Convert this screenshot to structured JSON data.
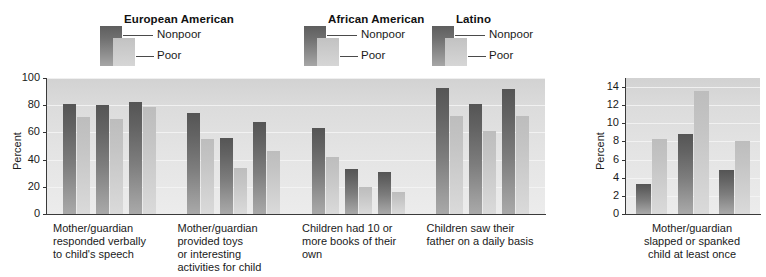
{
  "legend": {
    "groups": [
      {
        "title": "European American",
        "left": 78
      },
      {
        "title": "African American",
        "left": 282
      },
      {
        "title": "Latino",
        "left": 410
      }
    ],
    "series": [
      {
        "label": "Nonpoor",
        "swatch": "dark",
        "color": "#6f6f6f"
      },
      {
        "label": "Poor",
        "swatch": "light",
        "color": "#cacaca"
      }
    ]
  },
  "chart_data": [
    {
      "id": "main",
      "type": "bar",
      "title": "",
      "xlabel": "",
      "ylabel": "Percent",
      "ylim": [
        0,
        100
      ],
      "yticks": [
        0,
        20,
        40,
        60,
        80,
        100
      ],
      "grid": true,
      "legend_position": "above",
      "categories": [
        "Mother/guardian\nresponded verbally\nto child's speech",
        "Mother/guardian\nprovided toys\nor interesting\nactivities for child",
        "Children had 10 or\nmore books of their\nown",
        "Children saw their\nfather on a daily basis"
      ],
      "group_names": [
        "European American",
        "African American",
        "Latino"
      ],
      "series": [
        {
          "name": "Nonpoor",
          "values": [
            81,
            80,
            82,
            74,
            56,
            68,
            63,
            33,
            31,
            93,
            81,
            92
          ]
        },
        {
          "name": "Poor",
          "values": [
            71,
            70,
            79,
            55,
            34,
            46,
            42,
            20,
            16,
            72,
            61,
            72
          ]
        }
      ],
      "bars": [
        {
          "category": "Mother/guardian responded verbally to child's speech",
          "group": "European American",
          "nonpoor": 81,
          "poor": 71
        },
        {
          "category": "Mother/guardian responded verbally to child's speech",
          "group": "African American",
          "nonpoor": 80,
          "poor": 70
        },
        {
          "category": "Mother/guardian responded verbally to child's speech",
          "group": "Latino",
          "nonpoor": 82,
          "poor": 79
        },
        {
          "category": "Mother/guardian provided toys or interesting activities for child",
          "group": "European American",
          "nonpoor": 74,
          "poor": 55
        },
        {
          "category": "Mother/guardian provided toys or interesting activities for child",
          "group": "African American",
          "nonpoor": 56,
          "poor": 34
        },
        {
          "category": "Mother/guardian provided toys or interesting activities for child",
          "group": "Latino",
          "nonpoor": 68,
          "poor": 46
        },
        {
          "category": "Children had 10 or more books of their own",
          "group": "European American",
          "nonpoor": 63,
          "poor": 42
        },
        {
          "category": "Children had 10 or more books of their own",
          "group": "African American",
          "nonpoor": 33,
          "poor": 20
        },
        {
          "category": "Children had 10 or more books of their own",
          "group": "Latino",
          "nonpoor": 31,
          "poor": 16
        },
        {
          "category": "Children saw their father on a daily basis",
          "group": "European American",
          "nonpoor": 93,
          "poor": 72
        },
        {
          "category": "Children saw their father on a daily basis",
          "group": "African American",
          "nonpoor": 81,
          "poor": 61
        },
        {
          "category": "Children saw their father on a daily basis",
          "group": "Latino",
          "nonpoor": 92,
          "poor": 72
        }
      ]
    },
    {
      "id": "right",
      "type": "bar",
      "title": "",
      "xlabel": "",
      "ylabel": "Percent",
      "ylim": [
        0,
        15
      ],
      "yticks": [
        0,
        2,
        4,
        6,
        8,
        10,
        12,
        14
      ],
      "grid": true,
      "legend_position": "above",
      "categories": [
        "Mother/guardian\nslapped or spanked\nchild at least once"
      ],
      "group_names": [
        "European American",
        "African American",
        "Latino"
      ],
      "series": [
        {
          "name": "Nonpoor",
          "values": [
            3.3,
            8.8,
            4.8
          ]
        },
        {
          "name": "Poor",
          "values": [
            8.3,
            13.6,
            8.1
          ]
        }
      ],
      "bars": [
        {
          "category": "Mother/guardian slapped or spanked child at least once",
          "group": "European American",
          "nonpoor": 3.3,
          "poor": 8.3
        },
        {
          "category": "Mother/guardian slapped or spanked child at least once",
          "group": "African American",
          "nonpoor": 8.8,
          "poor": 13.6
        },
        {
          "category": "Mother/guardian slapped or spanked child at least once",
          "group": "Latino",
          "nonpoor": 4.8,
          "poor": 8.1
        }
      ]
    }
  ]
}
